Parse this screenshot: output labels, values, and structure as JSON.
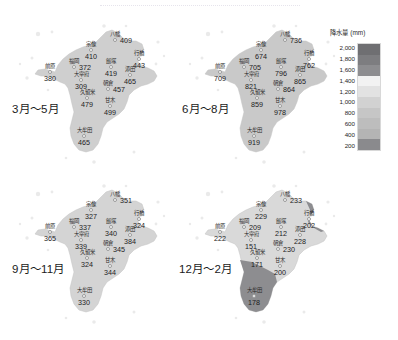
{
  "figure": {
    "type": "choropleth-map-grid",
    "region": "福岡県",
    "panel_count": 4
  },
  "legend": {
    "title": "降水量 (mm)",
    "unit": "mm",
    "ticks": [
      "2,000",
      "1,800",
      "1,600",
      "1,400",
      "1,200",
      "1,000",
      "800",
      "600",
      "400",
      "200"
    ],
    "colors": {
      "band_2000": "#6f6f72",
      "band_1800": "#7d7d80",
      "band_1600": "#8d8d90",
      "band_1400": "#f2f2f2",
      "band_1200": "#e2e2e2",
      "band_1000": "#d2d2d2",
      "band_800": "#c6c6c6",
      "band_600": "#bdbdbd",
      "band_400": "#b4b4b4",
      "band_200": "#8a8a8d"
    }
  },
  "panels": [
    {
      "label": "3月～5月",
      "fill": "#cfcfcf",
      "cities": [
        {
          "name": "八幡",
          "value": "409",
          "x": 107,
          "y": 28,
          "valpos": "right"
        },
        {
          "name": "宗像",
          "value": "410",
          "x": 83,
          "y": 38,
          "valpos": "below"
        },
        {
          "name": "行橋",
          "value": "443",
          "x": 131,
          "y": 47,
          "valpos": "below"
        },
        {
          "name": "飯塚",
          "value": "419",
          "x": 103,
          "y": 55,
          "valpos": "below"
        },
        {
          "name": "福岡",
          "value": "372",
          "x": 66,
          "y": 55,
          "valpos": "right"
        },
        {
          "name": "添田",
          "value": "465",
          "x": 122,
          "y": 63,
          "valpos": "below"
        },
        {
          "name": "前原",
          "value": "380",
          "x": 42,
          "y": 60,
          "valpos": "below"
        },
        {
          "name": "大宰府",
          "value": "309",
          "x": 73,
          "y": 68,
          "valpos": "below"
        },
        {
          "name": "朝倉",
          "value": "457",
          "x": 100,
          "y": 77,
          "valpos": "right"
        },
        {
          "name": "久留米",
          "value": "479",
          "x": 79,
          "y": 86,
          "valpos": "below"
        },
        {
          "name": "甘木",
          "value": "499",
          "x": 102,
          "y": 94,
          "valpos": "below"
        },
        {
          "name": "大牟田",
          "value": "465",
          "x": 76,
          "y": 124,
          "valpos": "below"
        }
      ]
    },
    {
      "label": "6月～8月",
      "fill": "#c9c9c9",
      "cities": [
        {
          "name": "八幡",
          "value": "736",
          "x": 107,
          "y": 28,
          "valpos": "right"
        },
        {
          "name": "宗像",
          "value": "674",
          "x": 83,
          "y": 38,
          "valpos": "below"
        },
        {
          "name": "行橋",
          "value": "762",
          "x": 131,
          "y": 47,
          "valpos": "below"
        },
        {
          "name": "飯塚",
          "value": "796",
          "x": 103,
          "y": 55,
          "valpos": "below"
        },
        {
          "name": "福岡",
          "value": "705",
          "x": 66,
          "y": 55,
          "valpos": "right"
        },
        {
          "name": "添田",
          "value": "865",
          "x": 122,
          "y": 63,
          "valpos": "below"
        },
        {
          "name": "前原",
          "value": "709",
          "x": 42,
          "y": 60,
          "valpos": "below"
        },
        {
          "name": "大宰府",
          "value": "821",
          "x": 73,
          "y": 68,
          "valpos": "below"
        },
        {
          "name": "朝倉",
          "value": "864",
          "x": 100,
          "y": 77,
          "valpos": "right"
        },
        {
          "name": "久留米",
          "value": "859",
          "x": 79,
          "y": 86,
          "valpos": "below"
        },
        {
          "name": "甘木",
          "value": "978",
          "x": 102,
          "y": 94,
          "valpos": "below"
        },
        {
          "name": "大牟田",
          "value": "919",
          "x": 76,
          "y": 124,
          "valpos": "below"
        }
      ]
    },
    {
      "label": "9月～11月",
      "fill": "#d4d4d4",
      "cities": [
        {
          "name": "八幡",
          "value": "351",
          "x": 107,
          "y": 28,
          "valpos": "right"
        },
        {
          "name": "宗像",
          "value": "327",
          "x": 83,
          "y": 38,
          "valpos": "below"
        },
        {
          "name": "行橋",
          "value": "324",
          "x": 131,
          "y": 47,
          "valpos": "below"
        },
        {
          "name": "飯塚",
          "value": "340",
          "x": 103,
          "y": 55,
          "valpos": "below"
        },
        {
          "name": "福岡",
          "value": "337",
          "x": 66,
          "y": 55,
          "valpos": "right"
        },
        {
          "name": "添田",
          "value": "384",
          "x": 122,
          "y": 63,
          "valpos": "below"
        },
        {
          "name": "前原",
          "value": "365",
          "x": 42,
          "y": 60,
          "valpos": "below"
        },
        {
          "name": "大宰府",
          "value": "339",
          "x": 73,
          "y": 68,
          "valpos": "below"
        },
        {
          "name": "朝倉",
          "value": "345",
          "x": 100,
          "y": 77,
          "valpos": "right"
        },
        {
          "name": "久留米",
          "value": "324",
          "x": 79,
          "y": 86,
          "valpos": "below"
        },
        {
          "name": "甘木",
          "value": "344",
          "x": 102,
          "y": 94,
          "valpos": "below"
        },
        {
          "name": "大牟田",
          "value": "330",
          "x": 76,
          "y": 124,
          "valpos": "below"
        }
      ]
    },
    {
      "label": "12月～2月",
      "fill": "#d9d9d9",
      "cities": [
        {
          "name": "八幡",
          "value": "233",
          "x": 107,
          "y": 28,
          "valpos": "right"
        },
        {
          "name": "宗像",
          "value": "229",
          "x": 83,
          "y": 38,
          "valpos": "below"
        },
        {
          "name": "行橋",
          "value": "202",
          "x": 131,
          "y": 47,
          "valpos": "below"
        },
        {
          "name": "飯塚",
          "value": "212",
          "x": 103,
          "y": 55,
          "valpos": "below"
        },
        {
          "name": "福岡",
          "value": "209",
          "x": 66,
          "y": 55,
          "valpos": "right"
        },
        {
          "name": "添田",
          "value": "228",
          "x": 122,
          "y": 63,
          "valpos": "below"
        },
        {
          "name": "前原",
          "value": "222",
          "x": 42,
          "y": 60,
          "valpos": "below"
        },
        {
          "name": "大宰府",
          "value": "151",
          "x": 73,
          "y": 68,
          "valpos": "below"
        },
        {
          "name": "朝倉",
          "value": "230",
          "x": 100,
          "y": 77,
          "valpos": "right"
        },
        {
          "name": "久留米",
          "value": "171",
          "x": 79,
          "y": 86,
          "valpos": "below"
        },
        {
          "name": "甘木",
          "value": "200",
          "x": 102,
          "y": 94,
          "valpos": "below"
        },
        {
          "name": "大牟田",
          "value": "178",
          "x": 76,
          "y": 124,
          "valpos": "below"
        }
      ]
    }
  ]
}
